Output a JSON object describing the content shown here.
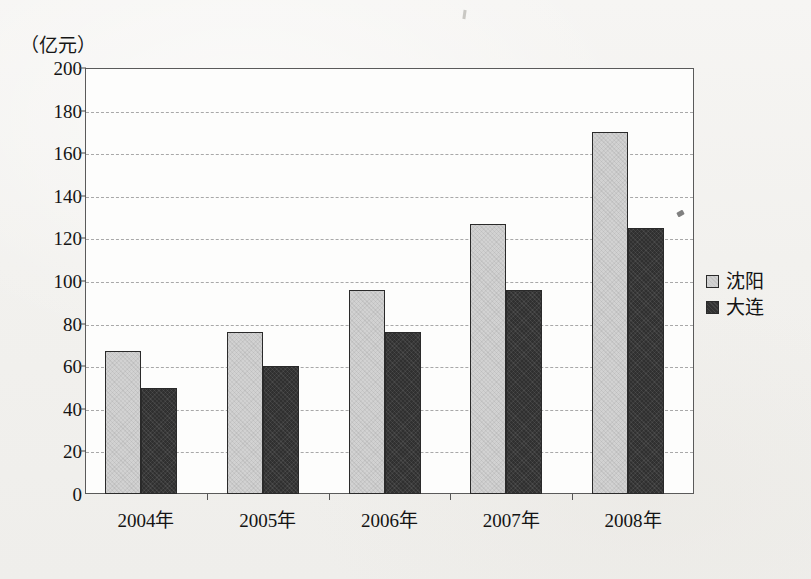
{
  "chart_data": {
    "type": "bar",
    "title": "",
    "subtitle": "",
    "xlabel": "",
    "ylabel": "",
    "unit_label": "（亿元）",
    "categories": [
      "2004年",
      "2005年",
      "2006年",
      "2007年",
      "2008年"
    ],
    "series": [
      {
        "name": "沈阳",
        "color": "#d2d2d2",
        "values": [
          67,
          76,
          96,
          127,
          170
        ]
      },
      {
        "name": "大连",
        "color": "#303030",
        "values": [
          50,
          60,
          76,
          96,
          125
        ]
      }
    ],
    "ylim": [
      0,
      200
    ],
    "ytick_step": 20,
    "yticks": [
      200,
      180,
      160,
      140,
      120,
      100,
      80,
      60,
      40,
      20,
      0
    ],
    "ytick_labels": [
      "200",
      "180",
      "160",
      "140",
      "120",
      "100",
      "80",
      "60",
      "40",
      "20",
      "0"
    ],
    "grid": "horizontal-dashed",
    "legend_position": "right"
  },
  "legend": {
    "items": [
      {
        "label": "沈阳",
        "swatch": "light-gray-swatch"
      },
      {
        "label": "大连",
        "swatch": "dark-gray-swatch"
      }
    ]
  }
}
